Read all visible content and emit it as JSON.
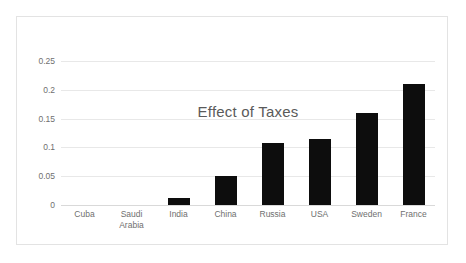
{
  "chart_data": {
    "type": "bar",
    "title": "Effect of Taxes",
    "xlabel": "",
    "ylabel": "",
    "categories": [
      "Cuba",
      "Saudi\nArabia",
      "India",
      "China",
      "Russia",
      "USA",
      "Sweden",
      "France"
    ],
    "values": [
      0,
      0.001,
      0.012,
      0.05,
      0.108,
      0.115,
      0.16,
      0.21
    ],
    "ylim": [
      0,
      0.25
    ],
    "yticks": [
      0,
      0.05,
      0.1,
      0.15,
      0.2,
      0.25
    ],
    "ytick_labels": [
      "0",
      "0.05",
      "0.1",
      "0.15",
      "0.2",
      "0.25"
    ],
    "grid": true,
    "legend": false,
    "bar_color": "#0d0d0d",
    "grid_color": "#e8e8e8",
    "text_color": "#6f6f6f",
    "title_color": "#5a5a5a",
    "frame_color": "#e3e3e3",
    "background": "#ffffff"
  }
}
